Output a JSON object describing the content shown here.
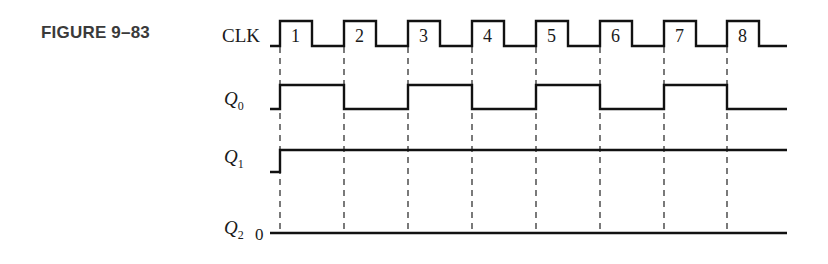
{
  "figure": {
    "label": "FIGURE 9–83"
  },
  "signals": {
    "clk": {
      "name": "CLK"
    },
    "q0": {
      "name": "Q",
      "sub": "0"
    },
    "q1": {
      "name": "Q",
      "sub": "1"
    },
    "q2": {
      "name": "Q",
      "sub": "2",
      "initial_value": "0"
    }
  },
  "clock_pulses": [
    "1",
    "2",
    "3",
    "4",
    "5",
    "6",
    "7",
    "8"
  ],
  "waveforms": {
    "clk": [
      0,
      1,
      0,
      1,
      0,
      1,
      0,
      1,
      0,
      1,
      0,
      1,
      0,
      1,
      0,
      1,
      0
    ],
    "q0": [
      0,
      1,
      0,
      1,
      0,
      1,
      0,
      1,
      0
    ],
    "q1": [
      0,
      1,
      1,
      1,
      1,
      1,
      1,
      1,
      1
    ],
    "q2": [
      0,
      0,
      0,
      0,
      0,
      0,
      0,
      0,
      0
    ]
  },
  "colors": {
    "line": "#111111",
    "dash": "#333333",
    "label": "#3a3a3a"
  }
}
